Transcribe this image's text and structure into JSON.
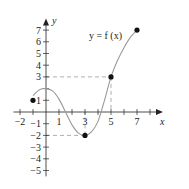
{
  "chart_data": {
    "type": "line",
    "title": "",
    "function_label": "y = f (x)",
    "xlabel": "x",
    "ylabel": "y",
    "xlim": [
      -2.5,
      9
    ],
    "ylim": [
      -5.5,
      8
    ],
    "x_ticks": [
      -2,
      -1,
      0,
      1,
      2,
      3,
      4,
      5,
      6,
      7,
      8
    ],
    "x_tick_labels": [
      {
        "value": -2,
        "label": "−2"
      },
      {
        "value": 1,
        "label": "1"
      },
      {
        "value": 3,
        "label": "3"
      },
      {
        "value": 5,
        "label": "5"
      },
      {
        "value": 7,
        "label": "7"
      }
    ],
    "y_ticks": [
      -5,
      -4,
      -3,
      -2,
      -1,
      1,
      2,
      3,
      4,
      5,
      6,
      7
    ],
    "y_tick_labels": [
      {
        "value": 7,
        "label": "7"
      },
      {
        "value": 6,
        "label": "6"
      },
      {
        "value": 5,
        "label": "5"
      },
      {
        "value": 4,
        "label": "4"
      },
      {
        "value": 3,
        "label": "3"
      },
      {
        "value": 1,
        "label": "1"
      },
      {
        "value": -1,
        "label": "−1"
      },
      {
        "value": -2,
        "label": "−2"
      },
      {
        "value": -3,
        "label": "−3"
      },
      {
        "value": -4,
        "label": "−4"
      },
      {
        "value": -5,
        "label": "−5"
      }
    ],
    "grid": false,
    "curve_points": [
      {
        "x": -1,
        "y": 1.4
      },
      {
        "x": -0.5,
        "y": 1.9
      },
      {
        "x": 0,
        "y": 2
      },
      {
        "x": 0.5,
        "y": 1.8
      },
      {
        "x": 1,
        "y": 1.1
      },
      {
        "x": 1.5,
        "y": 0
      },
      {
        "x": 2,
        "y": -1.1
      },
      {
        "x": 2.5,
        "y": -1.8
      },
      {
        "x": 3,
        "y": -2
      },
      {
        "x": 3.5,
        "y": -1.7
      },
      {
        "x": 4,
        "y": -0.8
      },
      {
        "x": 4.5,
        "y": 1
      },
      {
        "x": 5,
        "y": 3
      },
      {
        "x": 5.5,
        "y": 4.4
      },
      {
        "x": 6,
        "y": 5.5
      },
      {
        "x": 6.5,
        "y": 6.4
      },
      {
        "x": 7,
        "y": 7
      }
    ],
    "marked_points": [
      {
        "x": -1,
        "y": 1,
        "style": "filled"
      },
      {
        "x": 3,
        "y": -2,
        "style": "filled"
      },
      {
        "x": 5,
        "y": 3,
        "style": "filled"
      },
      {
        "x": 7,
        "y": 7,
        "style": "filled"
      }
    ],
    "guide_lines": [
      {
        "from": [
          0,
          3
        ],
        "to": [
          5,
          3
        ],
        "style": "dashed"
      },
      {
        "from": [
          5,
          3
        ],
        "to": [
          5,
          0
        ],
        "style": "dashed"
      },
      {
        "from": [
          0,
          -2
        ],
        "to": [
          3,
          -2
        ],
        "style": "dashed"
      },
      {
        "from": [
          3,
          -2
        ],
        "to": [
          3,
          0
        ],
        "style": "dashed"
      }
    ],
    "colors": {
      "axis": "#222222",
      "curve": "#9a9a9a",
      "dashed": "#999999",
      "point": "#111111"
    }
  }
}
